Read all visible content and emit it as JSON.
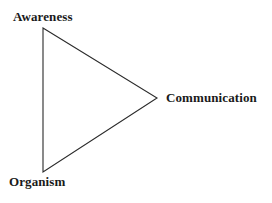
{
  "figure": {
    "type": "triangle-diagram",
    "background_color": "#ffffff",
    "stroke_color": "#2b2b2b",
    "text_color": "#1a1a1a",
    "stroke_width": 1.1,
    "width": 272,
    "height": 203
  },
  "vertices": [
    {
      "id": "awareness",
      "label": "Awareness",
      "x": 43,
      "y": 28,
      "position": "top-left"
    },
    {
      "id": "communication",
      "label": "Communication",
      "x": 157,
      "y": 98,
      "position": "right"
    },
    {
      "id": "organism",
      "label": "Organism",
      "x": 43,
      "y": 172,
      "position": "bottom-left"
    }
  ],
  "edges": [
    {
      "id": "awareness-organism",
      "from": "awareness",
      "to": "organism"
    },
    {
      "id": "awareness-communication",
      "from": "awareness",
      "to": "communication"
    },
    {
      "id": "organism-communication",
      "from": "organism",
      "to": "communication"
    }
  ],
  "polygon_points": "43,28 157,98 43,172"
}
